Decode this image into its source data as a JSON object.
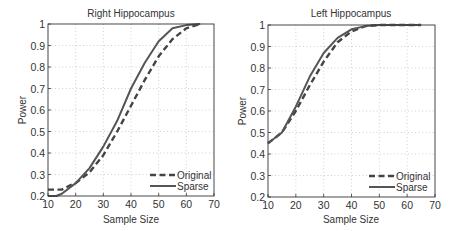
{
  "chart_data": [
    {
      "type": "line",
      "title": "Right Hippocampus",
      "xlabel": "Sample Size",
      "ylabel": "Power",
      "xlim": [
        10,
        70
      ],
      "ylim": [
        0.2,
        1
      ],
      "xticks": [
        "10",
        "20",
        "30",
        "40",
        "50",
        "60",
        "70"
      ],
      "yticks": [
        "0.2",
        "0.3",
        "0.4",
        "0.5",
        "0.6",
        "0.7",
        "0.8",
        "0.9",
        "1"
      ],
      "grid": true,
      "legend_position": "lower right",
      "series": [
        {
          "name": "Original",
          "style": "dashed",
          "x": [
            10,
            15,
            18,
            20,
            25,
            30,
            35,
            40,
            45,
            50,
            55,
            60,
            65
          ],
          "y": [
            0.23,
            0.23,
            0.25,
            0.26,
            0.31,
            0.39,
            0.5,
            0.62,
            0.74,
            0.85,
            0.93,
            0.98,
            1.0
          ]
        },
        {
          "name": "Sparse",
          "style": "solid",
          "x": [
            10,
            13,
            15,
            20,
            25,
            30,
            35,
            40,
            45,
            50,
            55,
            60,
            65
          ],
          "y": [
            0.2,
            0.2,
            0.21,
            0.26,
            0.33,
            0.43,
            0.55,
            0.7,
            0.82,
            0.92,
            0.98,
            0.995,
            1.0
          ]
        }
      ]
    },
    {
      "type": "line",
      "title": "Left Hippocampus",
      "xlabel": "Sample Size",
      "ylabel": "Power",
      "xlim": [
        10,
        70
      ],
      "ylim": [
        0.2,
        1
      ],
      "xticks": [
        "10",
        "20",
        "30",
        "40",
        "50",
        "60",
        "70"
      ],
      "yticks": [
        "0.2",
        "0.3",
        "0.4",
        "0.5",
        "0.6",
        "0.7",
        "0.8",
        "0.9",
        "1"
      ],
      "grid": true,
      "legend_position": "lower right",
      "series": [
        {
          "name": "Original",
          "style": "dashed",
          "x": [
            10,
            15,
            20,
            25,
            30,
            35,
            40,
            45,
            50,
            55,
            60,
            65
          ],
          "y": [
            0.45,
            0.5,
            0.6,
            0.72,
            0.83,
            0.92,
            0.97,
            0.995,
            1.0,
            1.0,
            1.0,
            1.0
          ]
        },
        {
          "name": "Sparse",
          "style": "solid",
          "x": [
            10,
            15,
            20,
            25,
            30,
            35,
            40,
            45,
            50,
            55,
            60,
            65
          ],
          "y": [
            0.45,
            0.5,
            0.62,
            0.76,
            0.87,
            0.94,
            0.98,
            0.995,
            1.0,
            1.0,
            1.0,
            1.0
          ]
        }
      ]
    }
  ]
}
